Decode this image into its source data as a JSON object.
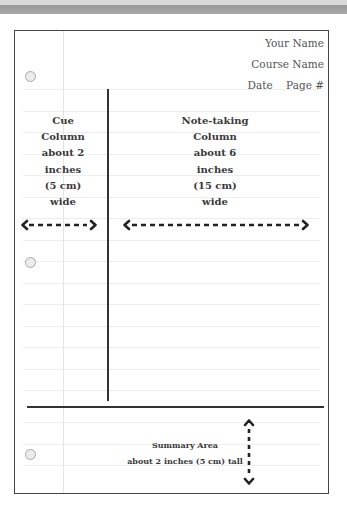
{
  "header": {
    "name": "Your Name",
    "course": "Course Name",
    "date_page": "Date    Page #"
  },
  "cue_column": {
    "lines": [
      "Cue",
      "Column",
      "about 2",
      "inches",
      "(5 cm)",
      "wide"
    ],
    "arrow_icon": "double-headed-horizontal-dashed-arrow"
  },
  "note_column": {
    "lines": [
      "Note-taking",
      "Column",
      "about 6",
      "inches",
      "(15 cm)",
      "wide"
    ],
    "arrow_icon": "double-headed-horizontal-dashed-arrow"
  },
  "summary": {
    "title": "Summary Area",
    "subtitle": "about 2 inches (5 cm) tall",
    "arrow_icon": "double-headed-vertical-dashed-arrow"
  },
  "colors": {
    "border": "#444444",
    "divider": "#333333",
    "rule_line": "#ededed",
    "margin_line": "#e4e4e4",
    "hole_fill": "#ececec",
    "top_band": "#a0a0a0"
  }
}
